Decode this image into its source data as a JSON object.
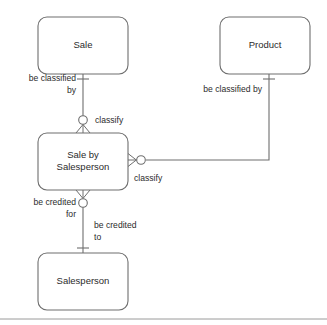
{
  "diagram": {
    "notation": "crow-foot",
    "colors": {
      "stroke": "#6e6e6e",
      "text": "#2b2b2b",
      "background": "#ffffff",
      "rule": "#9a9a9a"
    },
    "entities": [
      {
        "id": "sale",
        "label": "Sale",
        "label_line1": "Sale",
        "label_line2": ""
      },
      {
        "id": "product",
        "label": "Product",
        "label_line1": "Product",
        "label_line2": ""
      },
      {
        "id": "sale-by-person",
        "label": "Sale by Salesperson",
        "label_line1": "Sale by",
        "label_line2": "Salesperson"
      },
      {
        "id": "salesperson",
        "label": "Salesperson",
        "label_line1": "Salesperson",
        "label_line2": ""
      }
    ],
    "relationships": [
      {
        "id": "sale-classifies",
        "from": "sale",
        "to": "sale-by-person",
        "label_from": "be classified by",
        "label_from_line1": "be classified",
        "label_from_line2": "by",
        "label_to": "classify",
        "cardinality_from": "one",
        "cardinality_to": "zero-or-many"
      },
      {
        "id": "product-classifies",
        "from": "product",
        "to": "sale-by-person",
        "label_from": "be classified by",
        "label_from_line1": "be classified by",
        "label_from_line2": "",
        "label_to": "classify",
        "cardinality_from": "one",
        "cardinality_to": "zero-or-many"
      },
      {
        "id": "person-credited",
        "from": "sale-by-person",
        "to": "salesperson",
        "label_from": "be credited for",
        "label_from_line1": "be credited",
        "label_from_line2": "for",
        "label_to": "be credited to",
        "label_to_line1": "be credited",
        "label_to_line2": "to",
        "cardinality_from": "zero-or-many",
        "cardinality_to": "one"
      }
    ]
  }
}
